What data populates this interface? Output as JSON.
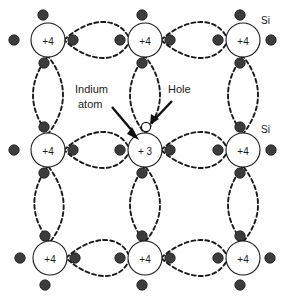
{
  "diagram": {
    "background_color": "#ffffff",
    "line_color": "#1a1a1a",
    "electron_color": "#3c3c3c",
    "atoms": [
      {
        "id": "a-r0c0",
        "label": "+4",
        "cx": 48,
        "cy": 40,
        "r": 17,
        "kind": "silicon"
      },
      {
        "id": "a-r0c1",
        "label": "+4",
        "cx": 145,
        "cy": 40,
        "r": 17,
        "kind": "silicon"
      },
      {
        "id": "a-r0c2",
        "label": "+4",
        "cx": 243,
        "cy": 40,
        "r": 17,
        "kind": "silicon"
      },
      {
        "id": "a-r1c0",
        "label": "+4",
        "cx": 48,
        "cy": 150,
        "r": 17,
        "kind": "silicon"
      },
      {
        "id": "a-r1c1",
        "label": "+ 3",
        "cx": 145,
        "cy": 150,
        "r": 17,
        "kind": "indium"
      },
      {
        "id": "a-r1c2",
        "label": "+4",
        "cx": 243,
        "cy": 150,
        "r": 17,
        "kind": "silicon"
      },
      {
        "id": "a-r2c0",
        "label": "+4",
        "cx": 50,
        "cy": 258,
        "r": 17,
        "kind": "silicon"
      },
      {
        "id": "a-r2c1",
        "label": "+4",
        "cx": 145,
        "cy": 258,
        "r": 17,
        "kind": "silicon"
      },
      {
        "id": "a-r2c2",
        "label": "+4",
        "cx": 243,
        "cy": 258,
        "r": 17,
        "kind": "silicon"
      }
    ],
    "labels": [
      {
        "id": "si-top",
        "text": "Si",
        "x": 261,
        "y": 22
      },
      {
        "id": "si-middle",
        "text": "Si",
        "x": 261,
        "y": 131
      }
    ],
    "callouts": [
      {
        "id": "indium-callout",
        "lines": [
          "Indium",
          "atom"
        ],
        "x": 75,
        "y": 93
      },
      {
        "id": "hole-callout",
        "lines": [
          "Hole"
        ],
        "x": 168,
        "y": 93
      }
    ],
    "hole_marker": {
      "cx": 146,
      "cy": 127,
      "r": 4.6,
      "filled": false
    },
    "notes": {
      "valence_silicon": "+4",
      "valence_indium": "+ 3"
    }
  }
}
